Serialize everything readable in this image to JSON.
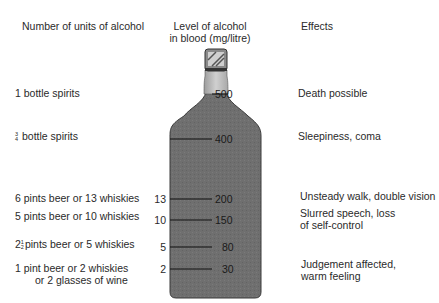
{
  "headers": {
    "units": "Number of units of alcohol",
    "level_line1": "Level of alcohol",
    "level_line2": "in blood (mg/litre)",
    "effects": "Effects"
  },
  "rows": [
    {
      "drinks_prefix": "",
      "drinks_fraction": null,
      "drinks": "1 bottle spirits",
      "drinks_line2": "",
      "units": "",
      "level": "500",
      "effect": "Death possible",
      "effect_line2": ""
    },
    {
      "drinks_prefix": "",
      "drinks_fraction": {
        "num": "3",
        "den": "4"
      },
      "drinks": "bottle spirits",
      "drinks_line2": "",
      "units": "",
      "level": "400",
      "effect": "Sleepiness, coma",
      "effect_line2": ""
    },
    {
      "drinks_prefix": "",
      "drinks_fraction": null,
      "drinks": "6 pints beer or 13 whiskies",
      "drinks_line2": "",
      "units": "13",
      "level": "200",
      "effect": "Unsteady walk, double vision",
      "effect_line2": ""
    },
    {
      "drinks_prefix": "",
      "drinks_fraction": null,
      "drinks": "5 pints beer or 10 whiskies",
      "drinks_line2": "",
      "units": "10",
      "level": "150",
      "effect": "Slurred speech, loss",
      "effect_line2": "of self-control"
    },
    {
      "drinks_prefix": "2",
      "drinks_fraction": {
        "num": "1",
        "den": "2"
      },
      "drinks": "pints beer or 5 whiskies",
      "drinks_line2": "",
      "units": "5",
      "level": "80",
      "effect": "",
      "effect_line2": ""
    },
    {
      "drinks_prefix": "",
      "drinks_fraction": null,
      "drinks": "1 pint beer or 2 whiskies",
      "drinks_line2": "or 2 glasses of wine",
      "units": "2",
      "level": "30",
      "effect": "Judgement affected,",
      "effect_line2": "warm feeling"
    }
  ],
  "colors": {
    "bottle_body": "#6e6e6e",
    "bottle_neck": "#b8b8b8",
    "cap": "#9a9a9a",
    "text": "#2a2a2a"
  }
}
